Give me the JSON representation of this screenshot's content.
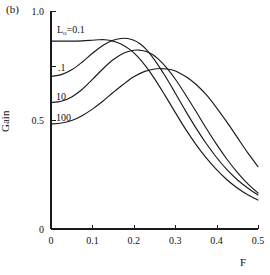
{
  "panel": {
    "label": "(b)"
  },
  "chart_data": {
    "type": "line",
    "title": "",
    "xlabel": "F",
    "ylabel": "Gain",
    "xlim": [
      0,
      0.5
    ],
    "ylim": [
      0,
      1.0
    ],
    "grid": false,
    "legend_position": "inline-curve-labels",
    "xticks": [
      0,
      0.1,
      0.2,
      0.3,
      0.4,
      0.5
    ],
    "xtick_labels": [
      "0",
      "0.1",
      "0.2",
      "0.3",
      "0.4",
      "0.5"
    ],
    "yticks": [
      0,
      0.5,
      1.0
    ],
    "ytick_labels": [
      "0",
      "0.5",
      "1.0"
    ],
    "yticks_minor": [
      0.75
    ],
    "series": [
      {
        "name": "L0=0.1",
        "label": "L₀=0.1",
        "label_prefix": "L",
        "label_sub": "o",
        "label_suffix": "=0.1",
        "color": "#1a1a1a",
        "x": [
          0,
          0.025,
          0.05,
          0.075,
          0.1,
          0.115,
          0.13,
          0.15,
          0.17,
          0.19,
          0.21,
          0.23,
          0.25,
          0.275,
          0.3,
          0.325,
          0.35,
          0.375,
          0.4,
          0.425,
          0.45,
          0.475,
          0.5
        ],
        "y": [
          0.862,
          0.862,
          0.862,
          0.863,
          0.866,
          0.868,
          0.868,
          0.862,
          0.848,
          0.824,
          0.79,
          0.744,
          0.69,
          0.614,
          0.535,
          0.458,
          0.388,
          0.326,
          0.272,
          0.226,
          0.188,
          0.157,
          0.133
        ]
      },
      {
        "name": ".1",
        "label": ".1",
        "color": "#1a1a1a",
        "x": [
          0,
          0.025,
          0.05,
          0.075,
          0.1,
          0.125,
          0.15,
          0.17,
          0.185,
          0.2,
          0.215,
          0.23,
          0.25,
          0.275,
          0.3,
          0.325,
          0.35,
          0.375,
          0.4,
          0.425,
          0.45,
          0.475,
          0.5
        ],
        "y": [
          0.7,
          0.708,
          0.73,
          0.765,
          0.806,
          0.842,
          0.866,
          0.874,
          0.874,
          0.866,
          0.85,
          0.824,
          0.776,
          0.704,
          0.624,
          0.542,
          0.464,
          0.392,
          0.328,
          0.272,
          0.226,
          0.188,
          0.156
        ]
      },
      {
        "name": "10",
        "label": "10",
        "color": "#1a1a1a",
        "x": [
          0,
          0.025,
          0.05,
          0.075,
          0.1,
          0.125,
          0.15,
          0.175,
          0.2,
          0.215,
          0.23,
          0.245,
          0.26,
          0.28,
          0.3,
          0.325,
          0.35,
          0.375,
          0.4,
          0.425,
          0.45,
          0.475,
          0.5
        ],
        "y": [
          0.58,
          0.586,
          0.606,
          0.64,
          0.686,
          0.734,
          0.776,
          0.806,
          0.82,
          0.82,
          0.814,
          0.8,
          0.778,
          0.738,
          0.688,
          0.616,
          0.54,
          0.462,
          0.388,
          0.32,
          0.26,
          0.208,
          0.165
        ]
      },
      {
        "name": "100",
        "label": "100",
        "color": "#1a1a1a",
        "x": [
          0,
          0.025,
          0.05,
          0.075,
          0.1,
          0.125,
          0.15,
          0.175,
          0.2,
          0.225,
          0.25,
          0.265,
          0.28,
          0.295,
          0.31,
          0.33,
          0.35,
          0.375,
          0.4,
          0.425,
          0.45,
          0.475,
          0.5
        ],
        "y": [
          0.482,
          0.486,
          0.498,
          0.52,
          0.55,
          0.586,
          0.626,
          0.664,
          0.698,
          0.722,
          0.734,
          0.736,
          0.734,
          0.728,
          0.716,
          0.694,
          0.664,
          0.616,
          0.556,
          0.49,
          0.42,
          0.35,
          0.286
        ]
      }
    ]
  }
}
